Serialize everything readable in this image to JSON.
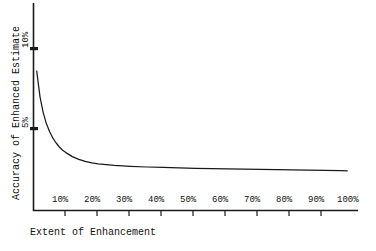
{
  "chart_data": {
    "type": "line",
    "title": "",
    "subtitle": "",
    "xlabel": "Extent of Enhancement",
    "ylabel": "Accuracy of Enhanced Estimate",
    "xlim": [
      0,
      100
    ],
    "ylim": [
      0,
      12
    ],
    "grid": false,
    "legend": null,
    "xticks": [
      "10%",
      "20%",
      "30%",
      "40%",
      "50%",
      "60%",
      "70%",
      "80%",
      "90%",
      "100%"
    ],
    "xtick_values": [
      10,
      20,
      30,
      40,
      50,
      60,
      70,
      80,
      90,
      100
    ],
    "yticks": [
      "10%",
      "5%"
    ],
    "ytick_values": [
      10,
      5
    ],
    "series": [
      {
        "name": "Accuracy of Enhanced Estimate",
        "x": [
          1,
          2,
          3,
          4,
          5,
          6,
          7,
          8,
          9,
          10,
          12,
          14,
          16,
          18,
          20,
          25,
          30,
          35,
          40,
          45,
          50,
          55,
          60,
          65,
          70,
          75,
          80,
          85,
          90,
          95,
          97
        ],
        "values": [
          8.6,
          7.0,
          6.0,
          5.3,
          4.8,
          4.4,
          4.1,
          3.85,
          3.65,
          3.5,
          3.25,
          3.08,
          2.95,
          2.86,
          2.8,
          2.7,
          2.64,
          2.6,
          2.57,
          2.54,
          2.52,
          2.5,
          2.48,
          2.46,
          2.45,
          2.43,
          2.42,
          2.4,
          2.39,
          2.37,
          2.36
        ]
      }
    ],
    "annotations": [],
    "line_color": "#1a1a1a",
    "axis_color": "#1a1a1a",
    "background": "#ffffff"
  },
  "axes": {
    "y_title": "Accuracy of Enhanced Estimate",
    "x_title": "Extent of Enhancement",
    "y_tick_10": "10%",
    "y_tick_5": "5%",
    "x_tick_10": "10%",
    "x_tick_20": "20%",
    "x_tick_30": "30%",
    "x_tick_40": "40%",
    "x_tick_50": "50%",
    "x_tick_60": "60%",
    "x_tick_70": "70%",
    "x_tick_80": "80%",
    "x_tick_90": "90%",
    "x_tick_100": "100%"
  }
}
